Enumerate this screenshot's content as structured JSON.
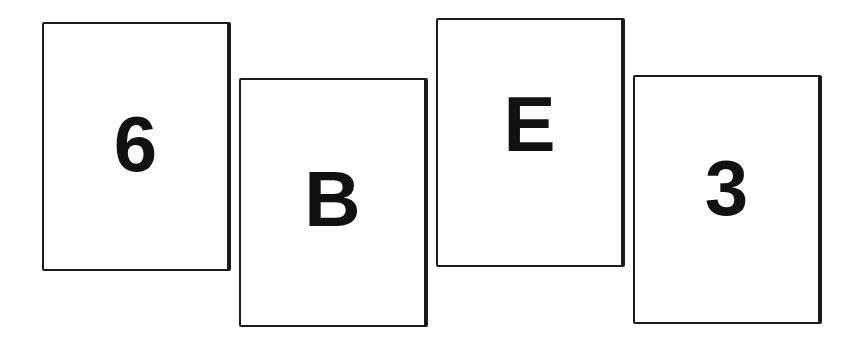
{
  "cards": [
    {
      "symbol": "6",
      "type": "number"
    },
    {
      "symbol": "B",
      "type": "letter"
    },
    {
      "symbol": "E",
      "type": "letter"
    },
    {
      "symbol": "3",
      "type": "number"
    }
  ],
  "colors": {
    "background": "#ffffff",
    "card_border": "#1a1a1a",
    "symbol": "#111111"
  }
}
